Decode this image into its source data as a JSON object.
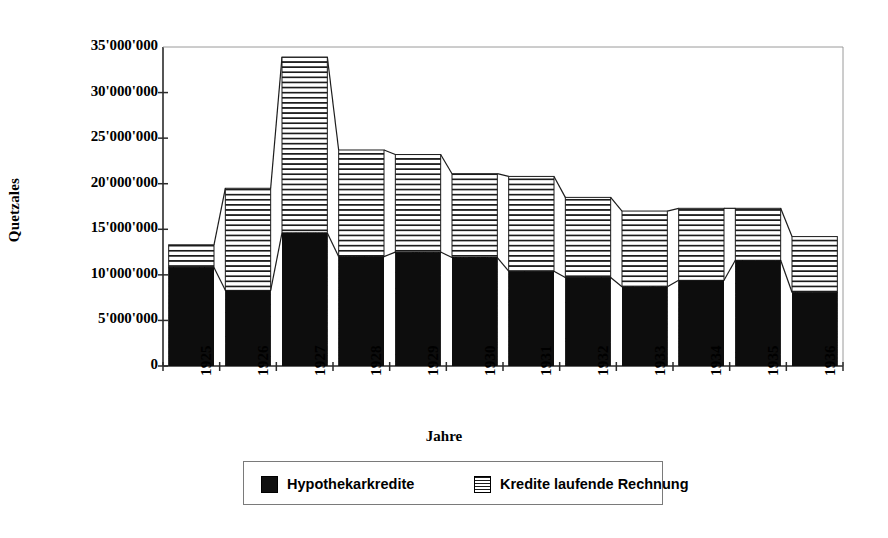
{
  "chart_data": {
    "type": "bar",
    "stacked": true,
    "title": "",
    "xlabel": "Jahre",
    "ylabel": "Quetzales",
    "categories": [
      "1925",
      "1926",
      "1927",
      "1928",
      "1929",
      "1930",
      "1931",
      "1932",
      "1933",
      "1934",
      "1935",
      "1936"
    ],
    "series": [
      {
        "name": "Hypothekarkredite",
        "pattern": "solid-black",
        "color": "#101010",
        "values": [
          10800000,
          8300000,
          14600000,
          12000000,
          12500000,
          11900000,
          10400000,
          9700000,
          8700000,
          9400000,
          11600000,
          8100000
        ]
      },
      {
        "name": "Kredite laufende Rechnung",
        "pattern": "horizontal-hatch",
        "color": "#ffffff",
        "values": [
          2500000,
          11200000,
          19300000,
          11700000,
          10700000,
          9200000,
          10400000,
          8800000,
          8300000,
          7900000,
          5700000,
          6100000
        ]
      }
    ],
    "totals": [
      13300000,
      19500000,
      33900000,
      23700000,
      23200000,
      21100000,
      20800000,
      18500000,
      17000000,
      17300000,
      17300000,
      14200000
    ],
    "ylim": [
      0,
      35000000
    ],
    "yticks": [
      0,
      5000000,
      10000000,
      15000000,
      20000000,
      25000000,
      30000000,
      35000000
    ],
    "ytick_labels": [
      "0",
      "5'000'000",
      "10'000'000",
      "15'000'000",
      "20'000'000",
      "25'000'000",
      "30'000'000",
      "35'000'000"
    ],
    "grid": false,
    "series_lines": true,
    "legend_position": "bottom"
  },
  "legend": {
    "entries": [
      {
        "label": "Hypothekarkredite"
      },
      {
        "label": "Kredite laufende Rechnung"
      }
    ]
  },
  "axes": {
    "y_title": "Quetzales",
    "x_title": "Jahre"
  }
}
